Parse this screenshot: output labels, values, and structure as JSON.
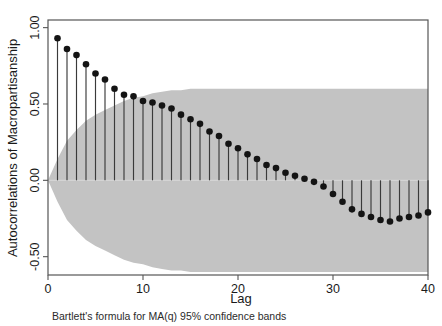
{
  "chart_data": {
    "type": "scatter",
    "title": "",
    "subtitle": "",
    "xlabel": "Lag",
    "ylabel": "Autocorrelations of Macropartisanship",
    "caption": "Bartlett's formula for MA(q) 95% confidence bands",
    "grid": false,
    "legend": "none",
    "xlim": [
      0,
      40
    ],
    "ylim": [
      -0.62,
      1.05
    ],
    "xticks": [
      0,
      10,
      20,
      30,
      40
    ],
    "xtick_labels": [
      "0",
      "10",
      "20",
      "30",
      "40"
    ],
    "yticks": [
      -0.5,
      0.0,
      0.5,
      1.0
    ],
    "ytick_labels": [
      "-0.50",
      "0.00",
      "0.50",
      "1.00"
    ],
    "x": [
      1,
      2,
      3,
      4,
      5,
      6,
      7,
      8,
      9,
      10,
      11,
      12,
      13,
      14,
      15,
      16,
      17,
      18,
      19,
      20,
      21,
      22,
      23,
      24,
      25,
      26,
      27,
      28,
      29,
      30,
      31,
      32,
      33,
      34,
      35,
      36,
      37,
      38,
      39,
      40
    ],
    "values": [
      0.93,
      0.86,
      0.82,
      0.76,
      0.7,
      0.66,
      0.6,
      0.56,
      0.55,
      0.52,
      0.51,
      0.49,
      0.47,
      0.43,
      0.4,
      0.37,
      0.32,
      0.29,
      0.24,
      0.21,
      0.17,
      0.14,
      0.1,
      0.08,
      0.05,
      0.03,
      0.01,
      -0.01,
      -0.04,
      -0.09,
      -0.14,
      -0.19,
      -0.22,
      -0.24,
      -0.26,
      -0.27,
      -0.25,
      -0.24,
      -0.23,
      -0.21
    ],
    "series": [
      {
        "name": "Autocorrelations of Macropartisanship",
        "marker": "filled-circle",
        "marker_color": "#141414",
        "stem_color": "#3a3a3a",
        "values": [
          0.93,
          0.86,
          0.82,
          0.76,
          0.7,
          0.66,
          0.6,
          0.56,
          0.55,
          0.52,
          0.51,
          0.49,
          0.47,
          0.43,
          0.4,
          0.37,
          0.32,
          0.29,
          0.24,
          0.21,
          0.17,
          0.14,
          0.1,
          0.08,
          0.05,
          0.03,
          0.01,
          -0.01,
          -0.04,
          -0.09,
          -0.14,
          -0.19,
          -0.22,
          -0.24,
          -0.26,
          -0.27,
          -0.25,
          -0.24,
          -0.23,
          -0.21
        ]
      }
    ],
    "confidence_band": {
      "label": "Bartlett's formula for MA(q) 95% confidence bands",
      "color": "#c3c3c3",
      "upper": [
        0.14,
        0.26,
        0.33,
        0.39,
        0.43,
        0.46,
        0.49,
        0.52,
        0.54,
        0.55,
        0.57,
        0.58,
        0.59,
        0.59,
        0.6,
        0.6,
        0.6,
        0.6,
        0.6,
        0.6,
        0.6,
        0.6,
        0.6,
        0.6,
        0.6,
        0.6,
        0.6,
        0.6,
        0.6,
        0.6,
        0.6,
        0.6,
        0.6,
        0.6,
        0.6,
        0.6,
        0.6,
        0.6,
        0.6,
        0.6
      ],
      "lower": [
        -0.14,
        -0.26,
        -0.33,
        -0.39,
        -0.43,
        -0.46,
        -0.49,
        -0.52,
        -0.54,
        -0.55,
        -0.57,
        -0.58,
        -0.59,
        -0.59,
        -0.6,
        -0.6,
        -0.6,
        -0.6,
        -0.6,
        -0.6,
        -0.6,
        -0.6,
        -0.6,
        -0.6,
        -0.6,
        -0.6,
        -0.6,
        -0.6,
        -0.6,
        -0.6,
        -0.6,
        -0.6,
        -0.6,
        -0.6,
        -0.6,
        -0.6,
        -0.6,
        -0.6,
        -0.6,
        -0.6
      ]
    },
    "zero_line": 0.0,
    "colors": {
      "marker": "#141414",
      "stem": "#3a3a3a",
      "band": "#c3c3c3",
      "frame": "#555555",
      "zero_line": "#d8d8d8",
      "background": "#ffffff"
    }
  },
  "axis": {
    "y_title": "Autocorrelations of Macropartisanship",
    "x_title": "Lag",
    "y_labels": [
      "1.00",
      "0.50",
      "0.00",
      "-0.50"
    ],
    "x_labels": [
      "0",
      "10",
      "20",
      "30",
      "40"
    ]
  },
  "footer": {
    "caption": "Bartlett's formula for MA(q) 95% confidence bands"
  }
}
